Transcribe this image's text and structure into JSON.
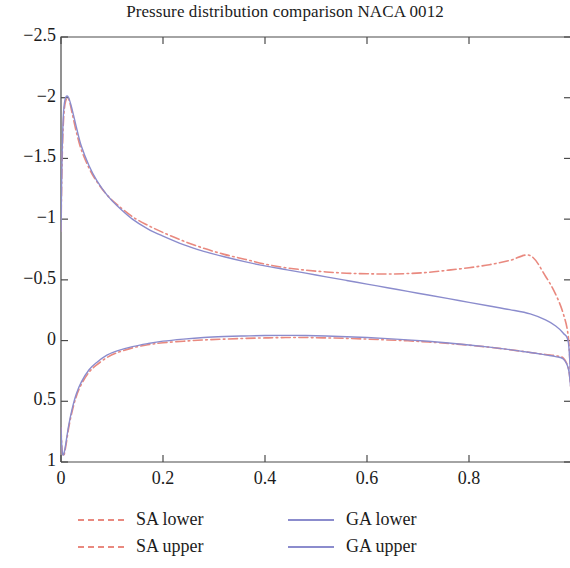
{
  "chart_data": {
    "type": "line",
    "title": "Pressure distribution comparison NACA 0012",
    "xlabel": "",
    "ylabel": "",
    "xlim": [
      0,
      1
    ],
    "ylim": [
      1,
      -2.5
    ],
    "y_inverted": true,
    "grid": false,
    "legend_position": "below-plot",
    "xticks": [
      0,
      0.2,
      0.4,
      0.6,
      0.8
    ],
    "xtick_labels": [
      "0",
      "0.2",
      "0.4",
      "0.6",
      "0.8"
    ],
    "yticks": [
      -2.5,
      -2,
      -1.5,
      -1,
      -0.5,
      0,
      0.5,
      1
    ],
    "ytick_labels": [
      "−2.5",
      "−2",
      "−1.5",
      "−1",
      "−0.5",
      "0",
      "0.5",
      "1"
    ],
    "series": [
      {
        "name": "SA lower",
        "color": "#e9897f",
        "style": "dashdot",
        "width": 1.6,
        "x": [
          0.0,
          0.002,
          0.005,
          0.009,
          0.015,
          0.022,
          0.03,
          0.04,
          0.055,
          0.07,
          0.09,
          0.11,
          0.14,
          0.17,
          0.2,
          0.24,
          0.28,
          0.32,
          0.36,
          0.4,
          0.44,
          0.48,
          0.52,
          0.56,
          0.6,
          0.64,
          0.68,
          0.72,
          0.76,
          0.8,
          0.84,
          0.88,
          0.92,
          0.95,
          0.97,
          0.985,
          0.995,
          1.0
        ],
        "y": [
          -0.9,
          -1.45,
          -1.82,
          -1.97,
          -1.99,
          -1.87,
          -1.72,
          -1.57,
          -1.42,
          -1.31,
          -1.2,
          -1.12,
          -1.02,
          -0.95,
          -0.89,
          -0.82,
          -0.76,
          -0.71,
          -0.67,
          -0.63,
          -0.6,
          -0.58,
          -0.565,
          -0.555,
          -0.55,
          -0.548,
          -0.552,
          -0.562,
          -0.58,
          -0.6,
          -0.625,
          -0.66,
          -0.7,
          -0.53,
          -0.38,
          -0.22,
          -0.02,
          0.38
        ]
      },
      {
        "name": "SA upper",
        "color": "#e9897f",
        "style": "dashdot",
        "width": 1.6,
        "x": [
          0.0,
          0.002,
          0.005,
          0.009,
          0.015,
          0.022,
          0.03,
          0.04,
          0.055,
          0.07,
          0.09,
          0.11,
          0.14,
          0.17,
          0.2,
          0.24,
          0.28,
          0.32,
          0.36,
          0.4,
          0.44,
          0.48,
          0.52,
          0.56,
          0.6,
          0.64,
          0.68,
          0.72,
          0.76,
          0.8,
          0.84,
          0.88,
          0.92,
          0.95,
          0.97,
          0.985,
          0.995,
          1.0
        ],
        "y": [
          0.72,
          0.9,
          0.95,
          0.88,
          0.72,
          0.58,
          0.46,
          0.36,
          0.26,
          0.2,
          0.14,
          0.1,
          0.06,
          0.035,
          0.018,
          0.005,
          -0.005,
          -0.012,
          -0.018,
          -0.022,
          -0.025,
          -0.025,
          -0.022,
          -0.018,
          -0.012,
          -0.005,
          0.002,
          0.012,
          0.024,
          0.038,
          0.055,
          0.075,
          0.098,
          0.115,
          0.125,
          0.145,
          0.23,
          0.4
        ]
      },
      {
        "name": "GA lower",
        "color": "#8b8ccd",
        "style": "solid",
        "width": 1.4,
        "x": [
          0.0,
          0.002,
          0.005,
          0.009,
          0.015,
          0.022,
          0.03,
          0.04,
          0.055,
          0.07,
          0.09,
          0.11,
          0.14,
          0.17,
          0.2,
          0.24,
          0.28,
          0.32,
          0.36,
          0.4,
          0.44,
          0.48,
          0.52,
          0.56,
          0.6,
          0.64,
          0.68,
          0.72,
          0.76,
          0.8,
          0.84,
          0.88,
          0.92,
          0.95,
          0.97,
          0.985,
          0.995,
          1.0
        ],
        "y": [
          -0.9,
          -1.5,
          -1.88,
          -2.0,
          -2.0,
          -1.9,
          -1.76,
          -1.6,
          -1.44,
          -1.32,
          -1.2,
          -1.11,
          -1.0,
          -0.92,
          -0.86,
          -0.79,
          -0.735,
          -0.69,
          -0.65,
          -0.615,
          -0.585,
          -0.555,
          -0.525,
          -0.495,
          -0.465,
          -0.435,
          -0.405,
          -0.375,
          -0.345,
          -0.315,
          -0.285,
          -0.255,
          -0.22,
          -0.17,
          -0.12,
          -0.06,
          0.02,
          0.39
        ]
      },
      {
        "name": "GA upper",
        "color": "#8b8ccd",
        "style": "solid",
        "width": 1.4,
        "x": [
          0.0,
          0.002,
          0.005,
          0.009,
          0.015,
          0.022,
          0.03,
          0.04,
          0.055,
          0.07,
          0.09,
          0.11,
          0.14,
          0.17,
          0.2,
          0.24,
          0.28,
          0.32,
          0.36,
          0.4,
          0.44,
          0.48,
          0.52,
          0.56,
          0.6,
          0.64,
          0.68,
          0.72,
          0.76,
          0.8,
          0.84,
          0.88,
          0.92,
          0.95,
          0.97,
          0.985,
          0.995,
          1.0
        ],
        "y": [
          0.72,
          0.9,
          0.94,
          0.86,
          0.7,
          0.56,
          0.44,
          0.34,
          0.24,
          0.18,
          0.12,
          0.085,
          0.05,
          0.025,
          0.005,
          -0.012,
          -0.025,
          -0.033,
          -0.038,
          -0.042,
          -0.043,
          -0.042,
          -0.038,
          -0.032,
          -0.025,
          -0.016,
          -0.006,
          0.006,
          0.02,
          0.036,
          0.054,
          0.075,
          0.098,
          0.118,
          0.132,
          0.152,
          0.235,
          0.41
        ]
      }
    ]
  },
  "legend": {
    "columns": [
      {
        "entries": [
          {
            "label": "SA lower",
            "color": "#e9897f",
            "style": "dashdot"
          },
          {
            "label": "SA upper",
            "color": "#e9897f",
            "style": "dashdot"
          }
        ]
      },
      {
        "entries": [
          {
            "label": "GA lower",
            "color": "#8b8ccd",
            "style": "solid"
          },
          {
            "label": "GA upper",
            "color": "#8b8ccd",
            "style": "solid"
          }
        ]
      }
    ]
  }
}
